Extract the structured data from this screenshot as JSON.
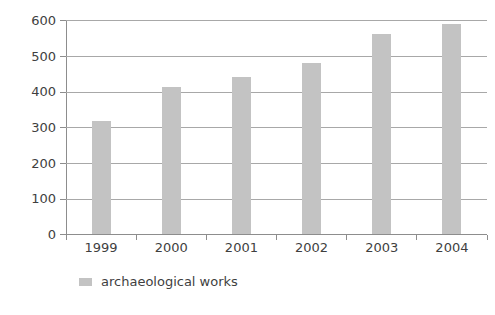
{
  "chart_data": {
    "type": "bar",
    "title": "",
    "subtitle": "",
    "xlabel": "",
    "ylabel": "",
    "categories": [
      "1999",
      "2000",
      "2001",
      "2002",
      "2003",
      "2004"
    ],
    "values": [
      318,
      412,
      440,
      480,
      560,
      590
    ],
    "series": [
      {
        "name": "archaeological works",
        "values": [
          318,
          412,
          440,
          480,
          560,
          590
        ],
        "color": "#c3c3c3"
      }
    ],
    "ylim": [
      0,
      600
    ],
    "ytick_values": [
      600,
      500,
      400,
      300,
      200,
      100,
      0
    ],
    "ytick_labels": [
      "600",
      "500",
      "400",
      "300",
      "200",
      "100",
      "0"
    ],
    "grid": true,
    "grid_axis": "y",
    "legend": {
      "position": "bottom-left",
      "entries": [
        {
          "label": "archaeological works",
          "color": "#c3c3c3"
        }
      ]
    },
    "colors": {
      "bar": "#c3c3c3",
      "axis": "#8d8d8d",
      "gridline": "#a8a8a8",
      "text": "#3f3f3f",
      "background": "#ffffff"
    }
  }
}
